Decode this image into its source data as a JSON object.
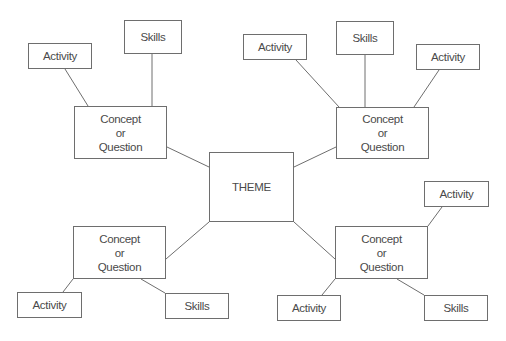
{
  "diagram": {
    "type": "concept-map",
    "colors": {
      "stroke": "#6e6e6e",
      "text": "#4a4a4a",
      "background": "#ffffff"
    },
    "theme": {
      "label": "THEME"
    },
    "nodes": [
      {
        "id": "theme",
        "label": "THEME",
        "x": 209,
        "y": 152,
        "w": 85,
        "h": 70
      },
      {
        "id": "c_tl",
        "label": "Concept\nor\nQuestion",
        "x": 74,
        "y": 106,
        "w": 93,
        "h": 53
      },
      {
        "id": "a_tl",
        "label": "Activity",
        "x": 28,
        "y": 43,
        "w": 64,
        "h": 26
      },
      {
        "id": "s_tl",
        "label": "Skills",
        "x": 124,
        "y": 20,
        "w": 58,
        "h": 34
      },
      {
        "id": "c_tr",
        "label": "Concept\nor\nQuestion",
        "x": 336,
        "y": 107,
        "w": 93,
        "h": 52
      },
      {
        "id": "a_tr1",
        "label": "Activity",
        "x": 243,
        "y": 34,
        "w": 64,
        "h": 26
      },
      {
        "id": "s_tr",
        "label": "Skills",
        "x": 336,
        "y": 21,
        "w": 58,
        "h": 34
      },
      {
        "id": "a_tr2",
        "label": "Activity",
        "x": 416,
        "y": 44,
        "w": 64,
        "h": 26
      },
      {
        "id": "c_bl",
        "label": "Concept\nor\nQuestion",
        "x": 73,
        "y": 226,
        "w": 93,
        "h": 53
      },
      {
        "id": "a_bl",
        "label": "Activity",
        "x": 17,
        "y": 292,
        "w": 65,
        "h": 26
      },
      {
        "id": "s_bl",
        "label": "Skills",
        "x": 165,
        "y": 293,
        "w": 64,
        "h": 26
      },
      {
        "id": "c_br",
        "label": "Concept\nor\nQuestion",
        "x": 335,
        "y": 226,
        "w": 93,
        "h": 53
      },
      {
        "id": "a_br1",
        "label": "Activity",
        "x": 424,
        "y": 181,
        "w": 65,
        "h": 26
      },
      {
        "id": "a_br2",
        "label": "Activity",
        "x": 277,
        "y": 295,
        "w": 64,
        "h": 26
      },
      {
        "id": "s_br",
        "label": "Skills",
        "x": 424,
        "y": 295,
        "w": 64,
        "h": 26
      }
    ],
    "edges": [
      {
        "from": "theme",
        "to": "c_tl",
        "x1": 209,
        "y1": 167,
        "x2": 167,
        "y2": 147
      },
      {
        "from": "theme",
        "to": "c_tr",
        "x1": 294,
        "y1": 167,
        "x2": 336,
        "y2": 147
      },
      {
        "from": "theme",
        "to": "c_bl",
        "x1": 209,
        "y1": 222,
        "x2": 166,
        "y2": 259
      },
      {
        "from": "theme",
        "to": "c_br",
        "x1": 294,
        "y1": 222,
        "x2": 335,
        "y2": 259
      },
      {
        "from": "c_tl",
        "to": "a_tl",
        "x1": 88,
        "y1": 106,
        "x2": 65,
        "y2": 69
      },
      {
        "from": "c_tl",
        "to": "s_tl",
        "x1": 152,
        "y1": 106,
        "x2": 152,
        "y2": 54
      },
      {
        "from": "c_tr",
        "to": "a_tr1",
        "x1": 339,
        "y1": 107,
        "x2": 296,
        "y2": 60
      },
      {
        "from": "c_tr",
        "to": "s_tr",
        "x1": 365,
        "y1": 107,
        "x2": 365,
        "y2": 55
      },
      {
        "from": "c_tr",
        "to": "a_tr2",
        "x1": 414,
        "y1": 107,
        "x2": 439,
        "y2": 70
      },
      {
        "from": "c_bl",
        "to": "a_bl",
        "x1": 73,
        "y1": 279,
        "x2": 63,
        "y2": 292
      },
      {
        "from": "c_bl",
        "to": "s_bl",
        "x1": 141,
        "y1": 279,
        "x2": 165,
        "y2": 293
      },
      {
        "from": "c_br",
        "to": "a_br1",
        "x1": 428,
        "y1": 226,
        "x2": 442,
        "y2": 207
      },
      {
        "from": "c_br",
        "to": "a_br2",
        "x1": 335,
        "y1": 279,
        "x2": 322,
        "y2": 295
      },
      {
        "from": "c_br",
        "to": "s_br",
        "x1": 397,
        "y1": 279,
        "x2": 424,
        "y2": 295
      }
    ]
  }
}
